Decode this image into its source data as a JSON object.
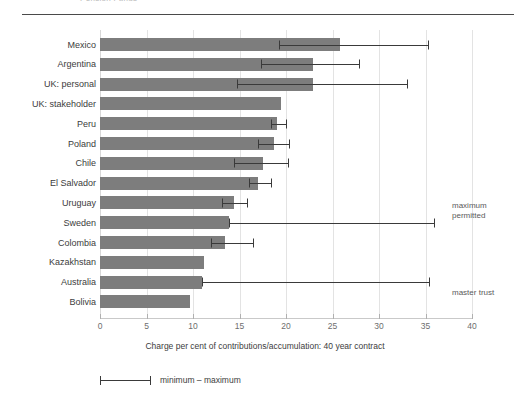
{
  "runhead": "Pension Funds",
  "chart_data": {
    "type": "bar",
    "orientation": "horizontal",
    "title": "",
    "xlabel": "Charge per cent of contributions/accumulation: 40 year contract",
    "ylabel": "",
    "xlim": [
      0,
      40
    ],
    "xticks": [
      0,
      5,
      10,
      15,
      20,
      25,
      30,
      35,
      40
    ],
    "grid": true,
    "legend": {
      "position": "bottom-left",
      "entries": [
        {
          "label": "minimum – maximum",
          "marker": "error-bar"
        }
      ]
    },
    "categories": [
      "Mexico",
      "Argentina",
      "UK: personal",
      "UK: stakeholder",
      "Peru",
      "Poland",
      "Chile",
      "El Salvador",
      "Uruguay",
      "Sweden",
      "Colombia",
      "Kazakhstan",
      "Australia",
      "Bolivia"
    ],
    "values": [
      25.8,
      22.9,
      22.9,
      19.5,
      19.0,
      18.7,
      17.5,
      17.0,
      14.4,
      13.9,
      13.4,
      11.2,
      11.0,
      9.7
    ],
    "error_min": [
      19.2,
      17.3,
      14.7,
      null,
      18.4,
      17.0,
      14.4,
      16.0,
      13.1,
      13.9,
      11.9,
      null,
      11.0,
      null
    ],
    "error_max": [
      35.3,
      27.8,
      33.0,
      null,
      20.0,
      20.3,
      20.2,
      18.4,
      15.8,
      35.9,
      16.5,
      null,
      35.4,
      null
    ],
    "annotations": [
      {
        "text_line1": "maximum",
        "text_line2": "permitted",
        "points_to": "Sweden"
      },
      {
        "text_line1": "master trust",
        "text_line2": "",
        "points_to": "Australia"
      }
    ],
    "bar_color": "#7d7d7d",
    "error_color": "#3a3a3a"
  }
}
